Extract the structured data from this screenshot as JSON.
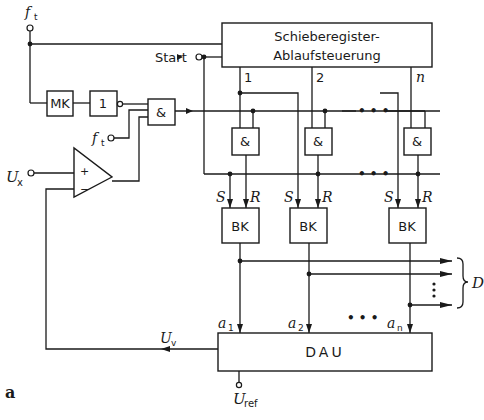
{
  "figure_label": "a",
  "sequencer": {
    "line1": "Schieberegister-",
    "line2": "Ablaufsteuerung"
  },
  "inputs": {
    "clock_top": {
      "symbol": "f",
      "sub": "t"
    },
    "clock_gate": {
      "symbol": "f",
      "sub": "t"
    },
    "start": "Start",
    "ux": {
      "symbol": "U",
      "sub": "x"
    },
    "uref": {
      "symbol": "U",
      "sub": "ref"
    }
  },
  "blocks": {
    "monoflop": "MK",
    "inverter": "1",
    "and_main": "&",
    "dac": "DAU"
  },
  "comparator": {
    "plus": "+",
    "minus": "−"
  },
  "channels": [
    {
      "tap": "1",
      "gate": "&",
      "flipflop": "BK",
      "set": "S",
      "reset": "R",
      "out": {
        "symbol": "a",
        "sub": "1"
      }
    },
    {
      "tap": "2",
      "gate": "&",
      "flipflop": "BK",
      "set": "S",
      "reset": "R",
      "out": {
        "symbol": "a",
        "sub": "2"
      }
    },
    {
      "tap": "n",
      "gate": "&",
      "flipflop": "BK",
      "set": "S",
      "reset": "R",
      "out": {
        "symbol": "a",
        "sub": "n"
      }
    }
  ],
  "ellipsis": "• • •",
  "feedback": {
    "symbol": "U",
    "sub": "v"
  },
  "digital_output": "D"
}
